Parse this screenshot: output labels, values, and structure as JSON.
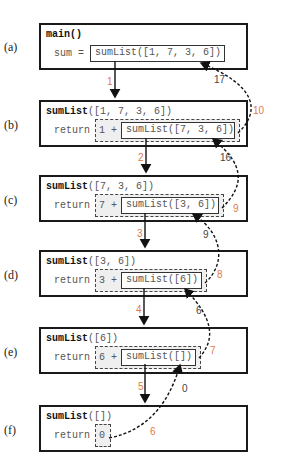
{
  "diagram": {
    "type": "recursion-call-trace",
    "frames": [
      {
        "label": "(a)",
        "title_bold": "main()",
        "title_rest": "",
        "prefix": "sum =",
        "addend": "",
        "call": "sumList([1, 7, 3, 6])"
      },
      {
        "label": "(b)",
        "title_bold": "sumList",
        "title_rest": "([1, 7, 3, 6])",
        "prefix": "return",
        "addend": "1 +",
        "call": "sumList([7, 3, 6])"
      },
      {
        "label": "(c)",
        "title_bold": "sumList",
        "title_rest": "([7, 3, 6])",
        "prefix": "return",
        "addend": "7 +",
        "call": "sumList([3, 6])"
      },
      {
        "label": "(d)",
        "title_bold": "sumList",
        "title_rest": "([3, 6])",
        "prefix": "return",
        "addend": "3 +",
        "call": "sumList([6])"
      },
      {
        "label": "(e)",
        "title_bold": "sumList",
        "title_rest": "([6])",
        "prefix": "return",
        "addend": "6 +",
        "call": "sumList([])"
      },
      {
        "label": "(f)",
        "title_bold": "sumList",
        "title_rest": "([])",
        "prefix": "return",
        "addend": "0",
        "call": ""
      }
    ],
    "call_steps": [
      "1",
      "2",
      "3",
      "4",
      "5"
    ],
    "return_steps": [
      "6",
      "7",
      "8",
      "9",
      "10"
    ],
    "return_values": [
      "0",
      "6",
      "9",
      "16",
      "17"
    ],
    "colors": {
      "step": "#e07a4a",
      "value": "#444444",
      "border": "#1a1a1a",
      "highlight_bg": "#efefef"
    }
  }
}
